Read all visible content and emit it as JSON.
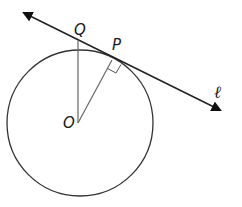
{
  "diagram": {
    "type": "geometry",
    "labels": {
      "Q": "Q",
      "P": "P",
      "O": "O",
      "line": "ℓ"
    },
    "elements": {
      "circle": {
        "center": "O",
        "cx": 80,
        "cy": 123,
        "r": 73
      },
      "tangent_line": {
        "name": "ℓ",
        "from": [
          22,
          12
        ],
        "to": [
          222,
          111
        ],
        "arrows": "both"
      },
      "segment_OP": {
        "from": "O",
        "to": "P"
      },
      "segment_OQ": {
        "from": "O",
        "to": "Q"
      },
      "right_angle_at": "P"
    },
    "colors": {
      "stroke": "#222222",
      "radius_stroke": "#555555",
      "background": "#ffffff"
    }
  }
}
